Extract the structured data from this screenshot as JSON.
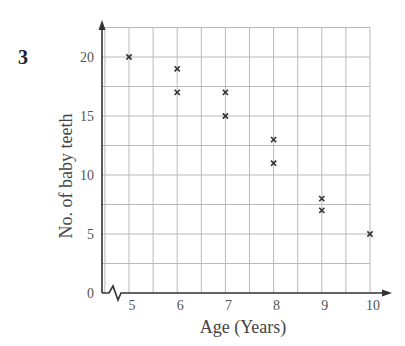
{
  "question_number": "3",
  "chart_data": {
    "type": "scatter",
    "title": "",
    "xlabel": "Age (Years)",
    "ylabel": "No. of baby teeth",
    "x_ticks": [
      5,
      6,
      7,
      8,
      9,
      10
    ],
    "y_ticks": [
      0,
      5,
      10,
      15,
      20
    ],
    "xlim": [
      5,
      10
    ],
    "ylim": [
      0,
      22.5
    ],
    "x_axis_break": true,
    "grid": true,
    "grid_x_step": 0.5,
    "grid_y_step": 2.5,
    "marker": "x",
    "points": [
      {
        "x": 5,
        "y": 20
      },
      {
        "x": 6,
        "y": 19
      },
      {
        "x": 6,
        "y": 17
      },
      {
        "x": 7,
        "y": 17
      },
      {
        "x": 7,
        "y": 15
      },
      {
        "x": 8,
        "y": 13
      },
      {
        "x": 8,
        "y": 11
      },
      {
        "x": 9,
        "y": 8
      },
      {
        "x": 9,
        "y": 7
      },
      {
        "x": 10,
        "y": 5
      }
    ],
    "legend": null
  },
  "colors": {
    "grid": "#b9b9b9",
    "axis": "#333333",
    "marker": "#333333",
    "text": "#444444"
  }
}
